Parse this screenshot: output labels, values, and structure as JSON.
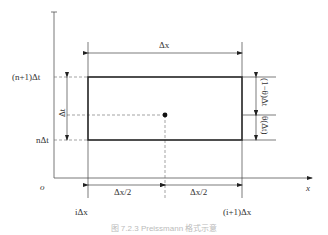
{
  "diagram": {
    "axes": {
      "x_label": "x",
      "origin_label": "o"
    },
    "y_labels": {
      "top": "(n+1)Δt",
      "bottom": "nΔt"
    },
    "x_labels": {
      "left": "iΔx",
      "right": "(i+1)Δx"
    },
    "dimensions": {
      "width": "Δx",
      "half_left": "Δx/2",
      "half_right": "Δx/2",
      "height": "Δt",
      "upper_right": "(1−θ)Δt",
      "lower_right": "θ(Δt)"
    },
    "caption": "图 7.2.3  Preissmann 格式示意"
  }
}
